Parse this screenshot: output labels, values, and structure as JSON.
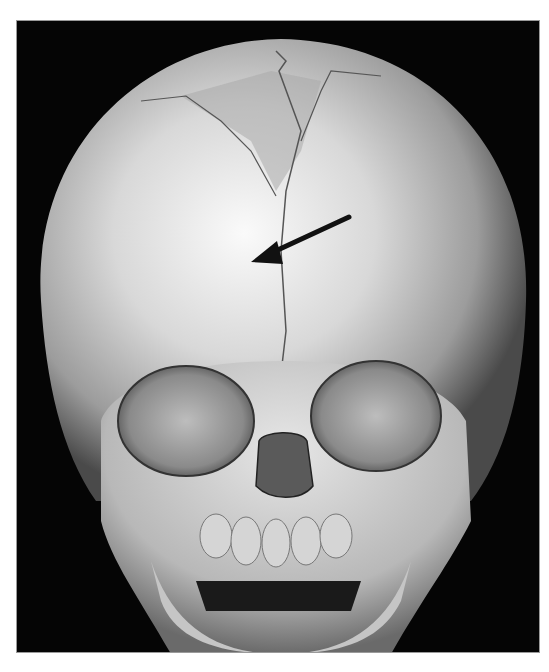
{
  "image": {
    "subject": "3D CT reconstruction of infant skull, frontal view",
    "background_color": "#050505",
    "bone_color": "#dcdcdc",
    "annotation": {
      "type": "arrow",
      "color": "#111111",
      "from": [
        348,
        216
      ],
      "to": [
        250,
        261
      ]
    }
  }
}
